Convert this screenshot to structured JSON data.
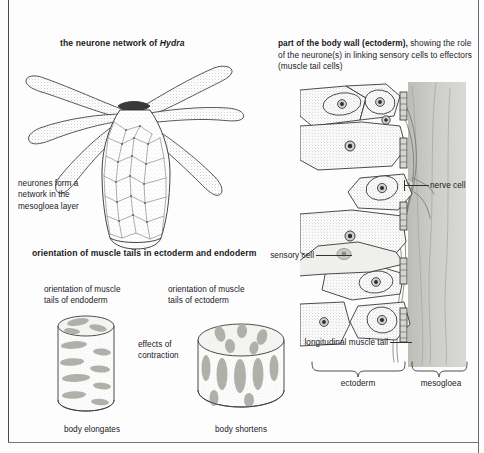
{
  "figure": {
    "panels": {
      "hydra": {
        "title_prefix": "the neurone network of ",
        "title_italic": "Hydra",
        "annotation": "neurones form a\nnetwork in the\nmesogloea layer",
        "annotation_lines": [
          "neurones form a",
          "network in the",
          "mesogloea layer"
        ]
      },
      "body_wall": {
        "title_bold": "part of the body wall (ectoderm),",
        "title_rest": " showing the role of the neurone(s) in linking sensory cells to effectors (muscle tail cells)",
        "labels": {
          "nerve_cell": "nerve cell",
          "sensory_cell": "sensory cell",
          "longitudinal_muscle_tail": "longitudinal muscle tail"
        },
        "braces": {
          "ectoderm": "ectoderm",
          "mesogloea": "mesogloea"
        }
      },
      "muscle_tails": {
        "heading": "orientation of muscle tails in ectoderm and endoderm",
        "left": {
          "label_lines": [
            "orientation of muscle",
            "tails of endoderm"
          ],
          "caption": "body elongates"
        },
        "right": {
          "label_lines": [
            "orientation of muscle",
            "tails of ectoderm"
          ],
          "caption": "body shortens"
        },
        "middle": {
          "label_lines": [
            "effects of",
            "contraction"
          ]
        }
      }
    },
    "colors": {
      "ink": "#1a1a1a",
      "outline": "#2b2b2b",
      "stipple": "#9a9a96",
      "mesogloea_band": "#c9c9c6",
      "muscle_fill": "#b3b3ae",
      "paper": "#fdfdfd"
    }
  }
}
